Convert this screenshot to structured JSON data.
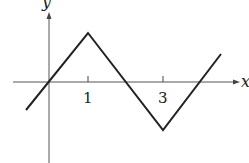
{
  "diagram": {
    "type": "piecewise-linear graph",
    "axes": {
      "x_label": "x",
      "y_label": "y"
    },
    "tick_labels": [
      "1",
      "3"
    ],
    "vertices": [
      [
        -0.6,
        -0.7
      ],
      [
        1,
        1.3
      ],
      [
        3,
        -1.3
      ],
      [
        4.5,
        0.7
      ]
    ],
    "line_color": "#222222"
  }
}
